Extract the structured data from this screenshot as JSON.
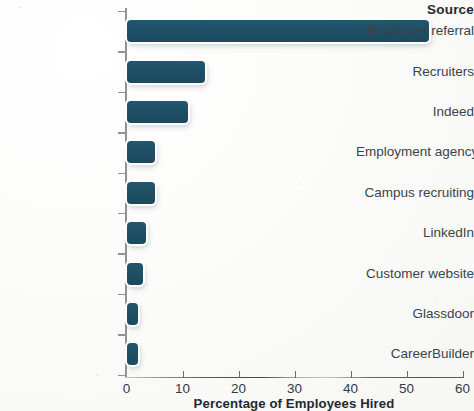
{
  "chart_data": {
    "type": "bar",
    "orientation": "horizontal",
    "title": "",
    "xlabel": "Percentage of Employees Hired",
    "ylabel": "Source",
    "categories": [
      "Employee referral",
      "Recruiters",
      "Indeed",
      "Employment agency",
      "Campus recruiting",
      "LinkedIn",
      "Customer website",
      "Glassdoor",
      "CareerBuilder"
    ],
    "values": [
      54,
      14,
      11,
      5,
      5,
      3.5,
      3,
      2,
      2
    ],
    "xlim": [
      0,
      60
    ],
    "xticks": [
      0,
      10,
      20,
      30,
      40,
      50,
      60
    ],
    "xtick_labels": [
      "0",
      "10",
      "20",
      "30",
      "40",
      "50",
      "60"
    ],
    "grid": false,
    "legend": false,
    "bar_color": "#1e4f65",
    "bar_outline_color": "#ffffff",
    "axis_color": "#8e9498",
    "text_color": "#39444a",
    "background_color": "#fdfdfd"
  },
  "axis": {
    "category_axis_title": "Source",
    "value_axis_title": "Percentage of Employees Hired"
  }
}
